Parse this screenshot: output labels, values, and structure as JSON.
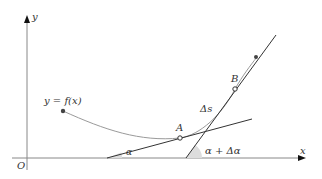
{
  "diagram": {
    "axes": {
      "x_label": "x",
      "y_label": "y",
      "origin_label": "O"
    },
    "curve_label": "y = f(x)",
    "points": {
      "A": "A",
      "B": "B"
    },
    "arc_label": "Δs",
    "angles": {
      "alpha": "α",
      "alpha_plus": "α + Δα"
    },
    "colors": {
      "axis": "#888888",
      "curve": "#9a9a9a",
      "tangent": "#333333",
      "angle_fill": "#dddddd"
    }
  }
}
